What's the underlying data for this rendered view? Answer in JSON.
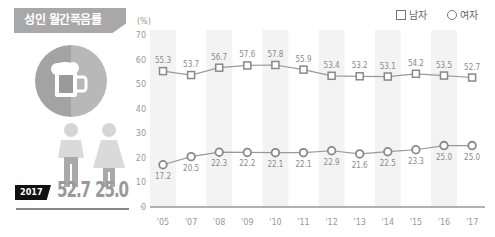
{
  "title": "성인 월간폭음률",
  "summary": {
    "year": "2017",
    "male_value": "52.7",
    "female_value": "25.0"
  },
  "icons": {
    "main": "beer-mug-icon",
    "male": "male-person-icon",
    "female": "female-person-icon"
  },
  "colors": {
    "title_bg": "#a8a8a8",
    "circle_left": "#a3a3a3",
    "circle_right": "#b8b8b8",
    "line": "#999999",
    "marker": "#888888",
    "band": "#f3f3f3",
    "badge": "#111111"
  },
  "legend": {
    "male": "남자",
    "female": "여자"
  },
  "chart_data": {
    "type": "line",
    "title": "성인 월간폭음률",
    "ylabel": "(%)",
    "xlabel": "",
    "ylim": [
      0,
      70
    ],
    "yticks": [
      0,
      10,
      20,
      30,
      40,
      50,
      60,
      70
    ],
    "categories": [
      "'05",
      "'07",
      "'08",
      "'09",
      "'10",
      "'11",
      "'12",
      "'13",
      "'14",
      "'15",
      "'16",
      "'17"
    ],
    "shaded_categories": [
      "'05",
      "'08",
      "'10",
      "'12",
      "'14",
      "'16"
    ],
    "legend_position": "top-right",
    "grid": false,
    "series": [
      {
        "name": "남자",
        "marker": "square",
        "values": [
          55.3,
          53.7,
          56.7,
          57.6,
          57.8,
          55.9,
          53.4,
          53.2,
          53.1,
          54.2,
          53.5,
          52.7
        ],
        "labels": [
          "55.3",
          "53.7",
          "56.7",
          "57.6",
          "57.8",
          "55.9",
          "53.4",
          "53.2",
          "53.1",
          "54.2",
          "53.5",
          "52.7"
        ]
      },
      {
        "name": "여자",
        "marker": "circle",
        "values": [
          17.2,
          20.5,
          22.3,
          22.2,
          22.1,
          22.1,
          22.9,
          21.6,
          22.5,
          23.3,
          25.0,
          25.0
        ],
        "labels": [
          "17.2",
          "20.5",
          "22.3",
          "22.2",
          "22.1",
          "22.1",
          "22.9",
          "21.6",
          "22.5",
          "23.3",
          "25.0",
          "25.0"
        ]
      }
    ]
  }
}
